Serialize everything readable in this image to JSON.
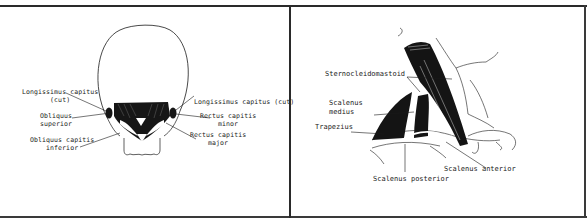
{
  "figure": {
    "panels": [
      {
        "id": "left",
        "subject": "posterior-skull-suboccipital-muscles",
        "labels": {
          "longissimus_left_line1": "Longissimus capitus",
          "longissimus_left_line2": "(cut)",
          "obliquus_superior_line1": "Obliquus",
          "obliquus_superior_line2": "superior",
          "obliquus_inferior_line1": "Obliquus capitis",
          "obliquus_inferior_line2": "inferior",
          "longissimus_right": "Longissimus capitus (cut)",
          "rectus_minor_line1": "Rectus capitis",
          "rectus_minor_line2": "minor",
          "rectus_major_line1": "Rectus capitis",
          "rectus_major_line2": "major"
        }
      },
      {
        "id": "right",
        "subject": "lateral-neck-muscles",
        "labels": {
          "sternocleidomastoid": "Sternocleidomastoid",
          "scalenus_medius_line1": "Scalenus",
          "scalenus_medius_line2": "medius",
          "trapezius": "Trapezius",
          "scalenus_anterior": "Scalenus anterior",
          "scalenus_posterior": "Scalenus posterior"
        }
      }
    ],
    "colors": {
      "ink": "#1a1a1a",
      "border": "#2a2a2a",
      "background": "#ffffff"
    }
  }
}
